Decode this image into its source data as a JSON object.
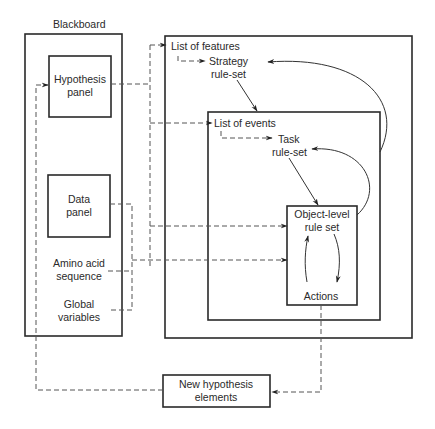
{
  "diagram": {
    "blackboard": {
      "title": "Blackboard",
      "hypothesis_panel": [
        "Hypothesis",
        "panel"
      ],
      "data_panel": [
        "Data",
        "panel"
      ],
      "amino_acid": [
        "Amino acid",
        "sequence"
      ],
      "global_vars": [
        "Global",
        "variables"
      ]
    },
    "control": {
      "list_of_features": "List of features",
      "strategy": [
        "Strategy",
        "rule-set"
      ],
      "list_of_events": "List of events",
      "task": [
        "Task",
        "rule-set"
      ],
      "object_level": [
        "Object-level",
        "rule set"
      ],
      "actions": "Actions"
    },
    "new_hypothesis": [
      "New hypothesis",
      "elements"
    ],
    "colors": {
      "ink": "#2a2a2a",
      "dash": "#555555",
      "background": "#ffffff"
    }
  }
}
